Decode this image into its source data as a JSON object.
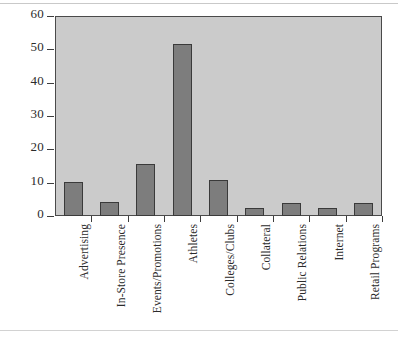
{
  "chart_data": {
    "type": "bar",
    "title": "",
    "subtitle": "",
    "xlabel": "",
    "ylabel": "",
    "ylim": [
      0,
      60
    ],
    "yticks": [
      0,
      10,
      20,
      30,
      40,
      50,
      60
    ],
    "grid": false,
    "legend": null,
    "orientation": "vertical",
    "categories": [
      "Advertising",
      "In-Store Presence",
      "Events/Promotions",
      "Athletes",
      "Colleges/Clubs",
      "Collateral",
      "Public Relations",
      "Internet",
      "Retail Programs"
    ],
    "values": [
      10.2,
      4.3,
      15.5,
      51.5,
      10.8,
      2.3,
      3.9,
      2.5,
      4.0
    ],
    "colors": {
      "bar_fill": "#7d7d7d",
      "bar_edge": "#3a3a3a",
      "plot_background": "#cbcbcb",
      "figure_background": "#ffffff",
      "axis": "#3d3d3d",
      "text": "#2b2b2b"
    }
  }
}
